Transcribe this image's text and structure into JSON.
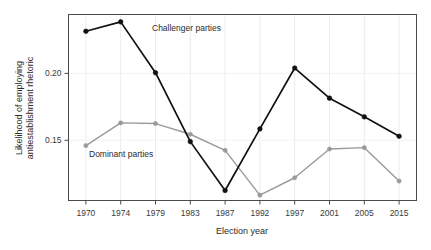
{
  "chart_data": {
    "type": "line",
    "title": "",
    "xlabel": "Election year",
    "ylabel": "Likelihood of employing antiestablishment rhetoric",
    "ylabel_line1": "Likelihood of employing",
    "ylabel_line2": "antiestablishment rhetoric",
    "categories": [
      "1970",
      "1974",
      "1979",
      "1983",
      "1987",
      "1992",
      "1997",
      "2001",
      "2005",
      "2015"
    ],
    "ytick_labels": [
      "0.15",
      "0.20"
    ],
    "ytick_values": [
      0.15,
      0.2
    ],
    "ylim": [
      0.105,
      0.244
    ],
    "grid": true,
    "grid_orientation": "vertical-and-horizontal",
    "legend_position": "inline-annotation",
    "series": [
      {
        "name": "Challenger parties",
        "color": "#111111",
        "marker": "filled-circle",
        "values": [
          0.2315,
          0.2385,
          0.2005,
          0.149,
          0.1125,
          null,
          0.204,
          0.1815,
          null,
          0.153
        ],
        "values_full": [
          0.2315,
          0.2385,
          0.2005,
          0.149,
          0.1125,
          0.1585,
          0.204,
          0.1815,
          0.1675,
          0.153
        ],
        "annotation": "Challenger parties",
        "annotation_at_x": "1974"
      },
      {
        "name": "Dominant parties",
        "color": "#9a9a9a",
        "marker": "filled-circle",
        "values": [
          0.146,
          0.163,
          0.1625,
          0.1545,
          0.1425,
          0.109,
          0.122,
          0.1435,
          0.1445,
          0.1195
        ],
        "annotation": "Dominant parties",
        "annotation_at_x": "1974"
      }
    ],
    "annotations": [
      {
        "text": "Challenger parties",
        "series": "Challenger parties",
        "x_px": 152,
        "y_px": 31
      },
      {
        "text": "Dominant parties",
        "series": "Dominant parties",
        "x_px": 89,
        "y_px": 157
      }
    ]
  }
}
